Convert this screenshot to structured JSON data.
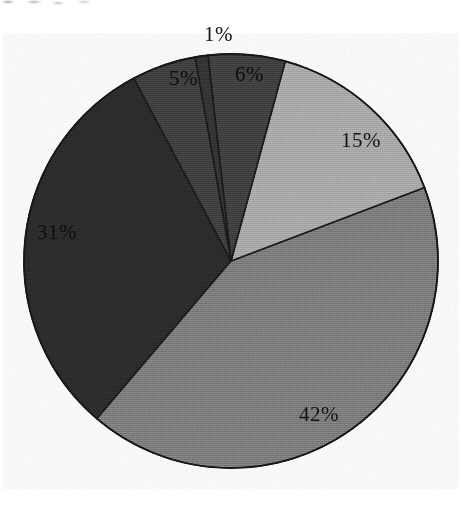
{
  "chart_data": {
    "type": "pie",
    "title": "",
    "subtitle": "",
    "xlabel": "",
    "ylabel": "",
    "legend_position": "none",
    "grid": false,
    "labels_shown": "percent",
    "start_angle_deg": -10,
    "direction": "clockwise",
    "categories": [
      "1%",
      "6%",
      "15%",
      "42%",
      "31%",
      "5%"
    ],
    "values": [
      1,
      6,
      15,
      42,
      31,
      5
    ],
    "slices": [
      {
        "label": "1%",
        "value": 1,
        "color": "#333333",
        "label_placement": "outside-top"
      },
      {
        "label": "6%",
        "value": 6,
        "color": "#3f3f3f",
        "label_placement": "inside"
      },
      {
        "label": "15%",
        "value": 15,
        "color": "#a9a9a9",
        "label_placement": "inside"
      },
      {
        "label": "42%",
        "value": 42,
        "color": "#7b7b7b",
        "label_placement": "inside"
      },
      {
        "label": "31%",
        "value": 31,
        "color": "#2c2c2c",
        "label_placement": "inside"
      },
      {
        "label": "5%",
        "value": 5,
        "color": "#3f3f3f",
        "label_placement": "inside"
      }
    ],
    "total": 100,
    "colors": {
      "slice_1": "#333333",
      "slice_6": "#3f3f3f",
      "slice_15": "#a9a9a9",
      "slice_42": "#7b7b7b",
      "slice_31": "#2c2c2c",
      "slice_5": "#3f3f3f",
      "outline": "#1a1a1a",
      "background": "#ffffff"
    },
    "geometry": {
      "center_x": 231,
      "center_y": 261,
      "radius": 207
    }
  }
}
